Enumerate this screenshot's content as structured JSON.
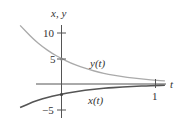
{
  "chart_data": {
    "type": "line",
    "title": "",
    "xlabel": "t",
    "ylabel": "x, y",
    "xlim": [
      -0.44,
      1.1
    ],
    "ylim": [
      -6,
      11.5
    ],
    "x_ticks": [
      {
        "value": 1,
        "label": "1"
      }
    ],
    "y_ticks": [
      {
        "value": 10,
        "label": "10"
      },
      {
        "value": 5,
        "label": "5"
      },
      {
        "value": -5,
        "label": "−5"
      }
    ],
    "grid": false,
    "series": [
      {
        "name": "y(t)",
        "label": "y(t)",
        "color": "#aaaaaa",
        "x": [
          -0.44,
          -0.3,
          -0.2,
          -0.1,
          0,
          0.1,
          0.2,
          0.3,
          0.4,
          0.5,
          0.6,
          0.7,
          0.8,
          0.9,
          1.0,
          1.1
        ],
        "values": [
          11.5,
          8.8,
          7.3,
          6.0,
          5.0,
          4.1,
          3.4,
          2.8,
          2.3,
          1.9,
          1.6,
          1.3,
          1.1,
          0.9,
          0.75,
          0.6
        ]
      },
      {
        "name": "x(t)",
        "label": "x(t)",
        "color": "#555555",
        "x": [
          -0.44,
          -0.3,
          -0.2,
          -0.1,
          0,
          0.1,
          0.2,
          0.3,
          0.4,
          0.5,
          0.6,
          0.7,
          0.8,
          0.9,
          1.0,
          1.1
        ],
        "values": [
          -4.6,
          -3.5,
          -2.9,
          -2.4,
          -2.0,
          -1.65,
          -1.36,
          -1.12,
          -0.93,
          -0.77,
          -0.64,
          -0.53,
          -0.44,
          -0.36,
          -0.3,
          -0.25
        ]
      }
    ],
    "annotations": [
      {
        "text": "y(t)",
        "near": "upper curve"
      },
      {
        "text": "x(t)",
        "near": "lower curve"
      }
    ]
  },
  "labels": {
    "yaxis": "x, y",
    "xaxis": "t",
    "tick_10": "10",
    "tick_5": "5",
    "tick_m5": "−5",
    "tick_1": "1",
    "ycurve": "y(t)",
    "xcurve": "x(t)"
  }
}
